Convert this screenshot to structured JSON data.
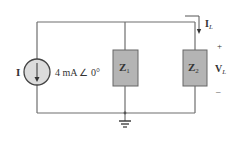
{
  "source": {
    "label": "I",
    "value": "4 mA ∠ 0°",
    "arrow_direction": "down",
    "fill": "#dcdcdc"
  },
  "impedances": [
    {
      "label_main": "Z",
      "label_sub": "1",
      "fill": "#b4b4b4"
    },
    {
      "label_main": "Z",
      "label_sub": "2",
      "fill": "#b4b4b4"
    }
  ],
  "load_current": {
    "label_main": "I",
    "label_sub": "L"
  },
  "load_voltage": {
    "label_main": "V",
    "label_sub": "L",
    "plus": "+",
    "minus": "–"
  },
  "ground": {
    "symbol": "ground-icon"
  },
  "colors": {
    "wire": "#6e6e6e",
    "text": "#333333"
  }
}
